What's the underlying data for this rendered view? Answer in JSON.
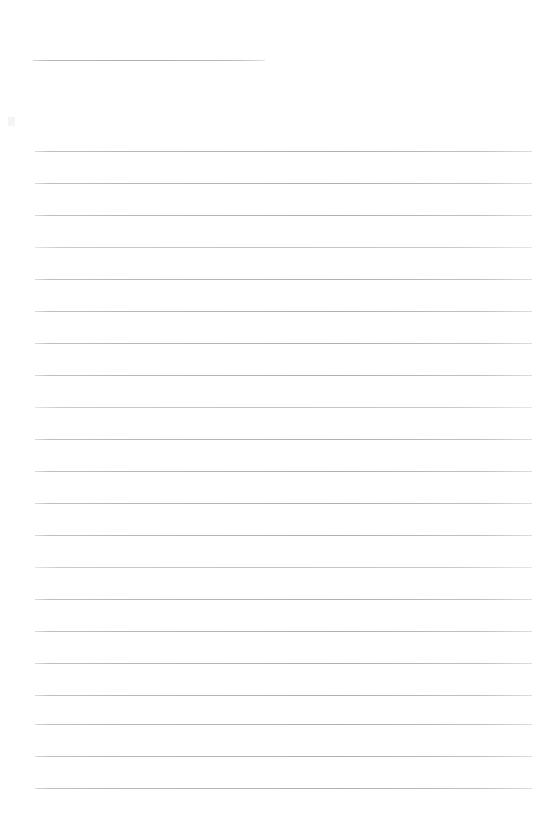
{
  "document": {
    "kind": "blank-ruled-worksheet",
    "page_width": 538,
    "page_height": 815,
    "background_color": "#ffffff",
    "rule_color": "#b4b4ba",
    "rule_color_faint": "#c4c4c9",
    "text_content": "",
    "has_text": false,
    "notes_label": ""
  },
  "header": {
    "blank_label": "",
    "rule": {
      "x": 33,
      "y": 60,
      "width": 232,
      "thickness": 1
    }
  },
  "body": {
    "line_count": 21,
    "left_margin": 35,
    "right_edge": 532,
    "line_width": 497,
    "line_spacing": 32,
    "first_line_y": 151,
    "last_line_y": 788,
    "lines": [
      {
        "index": 1,
        "y": 151,
        "faint": false,
        "value": ""
      },
      {
        "index": 2,
        "y": 183,
        "faint": false,
        "value": ""
      },
      {
        "index": 3,
        "y": 215,
        "faint": false,
        "value": ""
      },
      {
        "index": 4,
        "y": 247,
        "faint": true,
        "value": ""
      },
      {
        "index": 5,
        "y": 279,
        "faint": false,
        "value": ""
      },
      {
        "index": 6,
        "y": 311,
        "faint": false,
        "value": ""
      },
      {
        "index": 7,
        "y": 343,
        "faint": false,
        "value": ""
      },
      {
        "index": 8,
        "y": 375,
        "faint": false,
        "value": ""
      },
      {
        "index": 9,
        "y": 407,
        "faint": true,
        "value": ""
      },
      {
        "index": 10,
        "y": 439,
        "faint": false,
        "value": ""
      },
      {
        "index": 11,
        "y": 471,
        "faint": false,
        "value": ""
      },
      {
        "index": 12,
        "y": 503,
        "faint": false,
        "value": ""
      },
      {
        "index": 13,
        "y": 535,
        "faint": false,
        "value": ""
      },
      {
        "index": 14,
        "y": 567,
        "faint": true,
        "value": ""
      },
      {
        "index": 15,
        "y": 599,
        "faint": false,
        "value": ""
      },
      {
        "index": 16,
        "y": 631,
        "faint": false,
        "value": ""
      },
      {
        "index": 17,
        "y": 663,
        "faint": false,
        "value": ""
      },
      {
        "index": 18,
        "y": 695,
        "faint": false,
        "value": ""
      },
      {
        "index": 19,
        "y": 724,
        "faint": false,
        "value": ""
      },
      {
        "index": 20,
        "y": 756,
        "faint": false,
        "value": ""
      },
      {
        "index": 21,
        "y": 788,
        "faint": false,
        "value": ""
      }
    ]
  },
  "artifacts": {
    "speck": {
      "x": 8,
      "y": 117,
      "width": 7,
      "height": 9,
      "color": "#f4f4f6"
    }
  }
}
